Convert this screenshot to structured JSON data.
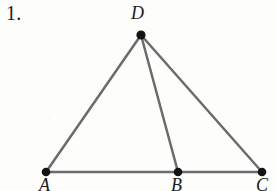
{
  "problem": {
    "number": "1."
  },
  "figure": {
    "type": "geometry-diagram",
    "background_color": "#fdfdfc",
    "line_color": "#6b6b6b",
    "vertex_color": "#141414",
    "line_width": 2.5,
    "vertex_radius": 4.3,
    "vertices": [
      {
        "label": "D",
        "x": 141,
        "y": 35,
        "label_x": 131,
        "label_y": 4
      },
      {
        "label": "A",
        "x": 46,
        "y": 172,
        "label_x": 39,
        "label_y": 176
      },
      {
        "label": "B",
        "x": 178,
        "y": 172,
        "label_x": 171,
        "label_y": 176
      },
      {
        "label": "C",
        "x": 262,
        "y": 172,
        "label_x": 256,
        "label_y": 176
      }
    ],
    "segments": [
      {
        "name": "DA",
        "from": "D",
        "to": "A",
        "x1": 141,
        "y1": 35,
        "x2": 46,
        "y2": 172
      },
      {
        "name": "DB",
        "from": "D",
        "to": "B",
        "x1": 141,
        "y1": 35,
        "x2": 178,
        "y2": 172
      },
      {
        "name": "DC",
        "from": "D",
        "to": "C",
        "x1": 141,
        "y1": 35,
        "x2": 262,
        "y2": 172
      },
      {
        "name": "AB",
        "from": "A",
        "to": "B",
        "x1": 46,
        "y1": 172,
        "x2": 178,
        "y2": 172
      },
      {
        "name": "BC",
        "from": "B",
        "to": "C",
        "x1": 178,
        "y1": 172,
        "x2": 262,
        "y2": 172
      }
    ]
  }
}
